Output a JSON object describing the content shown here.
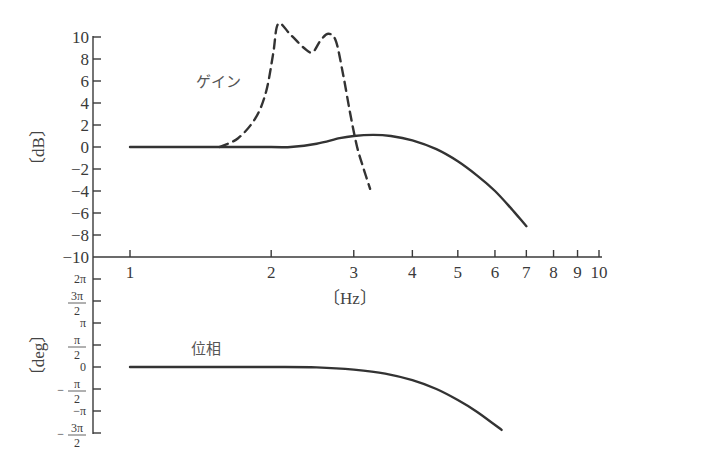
{
  "chart_data": [
    {
      "type": "line",
      "title": "",
      "panel": "gain",
      "xlabel": "〔Hz〕",
      "ylabel": "〔dB〕",
      "xscale": "log",
      "xlim": [
        1,
        10
      ],
      "ylim": [
        -10,
        10
      ],
      "x_ticks": [
        "1",
        "2",
        "3",
        "4",
        "5",
        "6",
        "7",
        "8",
        "9",
        "10"
      ],
      "y_ticks": [
        "10",
        "8",
        "6",
        "4",
        "2",
        "0",
        "−2",
        "−4",
        "−6",
        "−8",
        "−10"
      ],
      "annotations": [
        "ゲイン"
      ],
      "grid": false,
      "series": [
        {
          "name": "gain (solid)",
          "style": "solid",
          "x": [
            1.0,
            1.5,
            2.0,
            2.2,
            2.5,
            2.8,
            3.0,
            3.3,
            3.6,
            4.0,
            4.5,
            5.0,
            5.5,
            6.0,
            6.5,
            7.0
          ],
          "values": [
            0.0,
            0.0,
            0.0,
            0.0,
            0.3,
            0.8,
            1.0,
            1.1,
            1.0,
            0.6,
            -0.2,
            -1.3,
            -2.6,
            -4.0,
            -5.6,
            -7.2
          ]
        },
        {
          "name": "gain (dashed)",
          "style": "dashed",
          "x": [
            1.55,
            1.7,
            1.85,
            1.95,
            2.02,
            2.07,
            2.2,
            2.35,
            2.45,
            2.55,
            2.65,
            2.75,
            2.85,
            2.95,
            3.05,
            3.15,
            3.25
          ],
          "values": [
            0.0,
            0.8,
            2.6,
            5.0,
            8.5,
            11.2,
            10.2,
            9.0,
            8.6,
            9.7,
            10.3,
            9.6,
            6.5,
            3.0,
            0.0,
            -2.0,
            -3.8
          ]
        }
      ]
    },
    {
      "type": "line",
      "title": "",
      "panel": "phase",
      "xlabel": "〔Hz〕",
      "ylabel": "〔deg〕",
      "xscale": "log",
      "xlim": [
        1,
        10
      ],
      "ylim": [
        "-3π/2",
        "2π"
      ],
      "y_ticks": [
        "2π",
        "3π/2",
        "π",
        "π/2",
        "0",
        "−π/2",
        "−π",
        "−3π/2"
      ],
      "annotations": [
        "位相"
      ],
      "grid": false,
      "series": [
        {
          "name": "phase",
          "style": "solid",
          "units": "multiples of π",
          "x": [
            1.0,
            1.5,
            2.0,
            2.5,
            3.0,
            3.5,
            4.0,
            4.5,
            5.0,
            5.5,
            6.2
          ],
          "values": [
            0.0,
            0.0,
            0.0,
            -0.01,
            -0.06,
            -0.15,
            -0.3,
            -0.5,
            -0.75,
            -1.02,
            -1.43
          ]
        }
      ]
    }
  ],
  "labels": {
    "gain_unit": "〔dB〕",
    "phase_unit": "〔deg〕",
    "freq_unit": "〔Hz〕",
    "gain_annotation": "ゲイン",
    "phase_annotation": "位相"
  },
  "x_ticks": [
    {
      "label": "1",
      "f": 1
    },
    {
      "label": "2",
      "f": 2
    },
    {
      "label": "3",
      "f": 3
    },
    {
      "label": "4",
      "f": 4
    },
    {
      "label": "5",
      "f": 5
    },
    {
      "label": "6",
      "f": 6
    },
    {
      "label": "7",
      "f": 7
    },
    {
      "label": "8",
      "f": 8
    },
    {
      "label": "9",
      "f": 9
    },
    {
      "label": "10",
      "f": 10
    }
  ],
  "gain_ticks": [
    {
      "label": "10",
      "v": 10
    },
    {
      "label": "8",
      "v": 8
    },
    {
      "label": "6",
      "v": 6
    },
    {
      "label": "4",
      "v": 4
    },
    {
      "label": "2",
      "v": 2
    },
    {
      "label": "0",
      "v": 0
    },
    {
      "label": "−2",
      "v": -2
    },
    {
      "label": "−4",
      "v": -4
    },
    {
      "label": "−6",
      "v": -6
    },
    {
      "label": "−8",
      "v": -8
    },
    {
      "label": "−10",
      "v": -10
    }
  ],
  "phase_ticks": [
    {
      "num": "2π",
      "den": "",
      "sign": "",
      "v": 4
    },
    {
      "num": "3π",
      "den": "2",
      "sign": "",
      "v": 3
    },
    {
      "num": "π",
      "den": "",
      "sign": "",
      "v": 2
    },
    {
      "num": "π",
      "den": "2",
      "sign": "",
      "v": 1
    },
    {
      "num": "0",
      "den": "",
      "sign": "",
      "v": 0
    },
    {
      "num": "π",
      "den": "2",
      "sign": "−",
      "v": -1
    },
    {
      "num": "π",
      "den": "",
      "sign": "−",
      "v": -2
    },
    {
      "num": "3π",
      "den": "2",
      "sign": "−",
      "v": -3
    }
  ],
  "colors": {
    "ink": "#333333",
    "axis": "#3a3a3a",
    "background": "#ffffff"
  }
}
